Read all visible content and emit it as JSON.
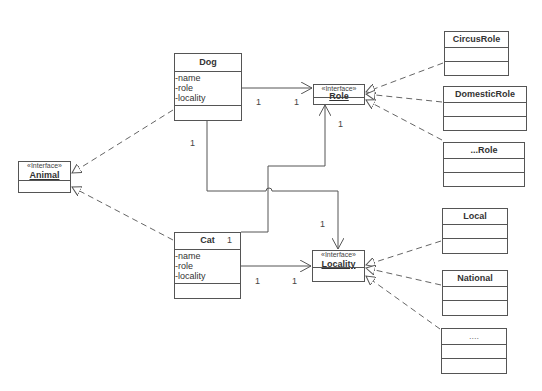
{
  "diagram": {
    "type": "UML class diagram",
    "interfaces": [
      {
        "id": "animal",
        "stereotype": "«Interface»",
        "name": "Animal"
      },
      {
        "id": "role",
        "stereotype": "«Interface»",
        "name": "Role"
      },
      {
        "id": "locality",
        "stereotype": "«Interface»",
        "name": "Locality"
      }
    ],
    "classes": [
      {
        "id": "dog",
        "name": "Dog",
        "attributes": [
          "-name",
          "-role",
          "-locality"
        ]
      },
      {
        "id": "cat",
        "name": "Cat",
        "attributes": [
          "-name",
          "-role",
          "-locality"
        ]
      },
      {
        "id": "circusrole",
        "name": "CircusRole"
      },
      {
        "id": "domesticrole",
        "name": "DomesticRole"
      },
      {
        "id": "otherrole",
        "name": "...Role"
      },
      {
        "id": "local",
        "name": "Local"
      },
      {
        "id": "national",
        "name": "National"
      },
      {
        "id": "otherlocality",
        "name": "...."
      }
    ],
    "multiplicities": {
      "dog_role_source": "1",
      "dog_role_target": "1",
      "dog_locality_source": "1",
      "dog_locality_target": "1",
      "cat_role_source": "1",
      "cat_role_target": "1",
      "cat_locality_source": "1",
      "cat_locality_target": "1"
    },
    "relationships": [
      {
        "from": "Dog",
        "to": "Animal",
        "kind": "realization"
      },
      {
        "from": "Cat",
        "to": "Animal",
        "kind": "realization"
      },
      {
        "from": "CircusRole",
        "to": "Role",
        "kind": "realization"
      },
      {
        "from": "DomesticRole",
        "to": "Role",
        "kind": "realization"
      },
      {
        "from": "...Role",
        "to": "Role",
        "kind": "realization"
      },
      {
        "from": "Local",
        "to": "Locality",
        "kind": "realization"
      },
      {
        "from": "National",
        "to": "Locality",
        "kind": "realization"
      },
      {
        "from": "....",
        "to": "Locality",
        "kind": "realization"
      },
      {
        "from": "Dog",
        "to": "Role",
        "kind": "association",
        "multiplicity": [
          "1",
          "1"
        ]
      },
      {
        "from": "Dog",
        "to": "Locality",
        "kind": "association",
        "multiplicity": [
          "1",
          "1"
        ]
      },
      {
        "from": "Cat",
        "to": "Role",
        "kind": "association",
        "multiplicity": [
          "1",
          "1"
        ]
      },
      {
        "from": "Cat",
        "to": "Locality",
        "kind": "association",
        "multiplicity": [
          "1",
          "1"
        ]
      }
    ]
  }
}
